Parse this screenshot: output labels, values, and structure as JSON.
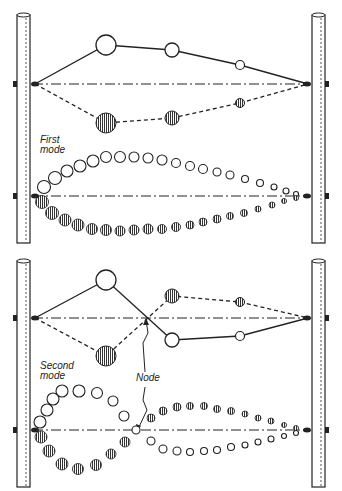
{
  "figure": {
    "panels": [
      {
        "name": "first-mode",
        "label_line1": "First",
        "label_line2": "mode"
      },
      {
        "name": "second-mode",
        "label_line1": "Second",
        "label_line2": "mode",
        "node_label": "Node"
      }
    ]
  },
  "colors": {
    "ink": "#222222",
    "background": "#ffffff"
  }
}
